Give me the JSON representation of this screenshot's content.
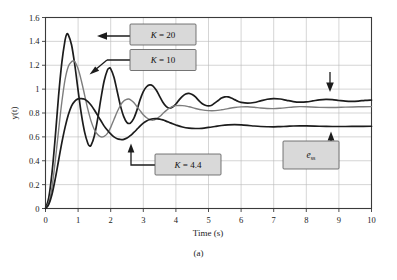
{
  "figure": {
    "caption": "(a)"
  },
  "chart_data": {
    "type": "line",
    "title": "",
    "subtitle": "",
    "xlabel": "Time (s)",
    "ylabel": "y(t)",
    "xlim": [
      0,
      10
    ],
    "ylim": [
      0,
      1.6
    ],
    "grid": true,
    "legend_position": "inline-annotations",
    "xticks": [
      "0",
      "1",
      "2",
      "3",
      "4",
      "5",
      "6",
      "7",
      "8",
      "9",
      "10"
    ],
    "xtick_values": [
      0,
      1,
      2,
      3,
      4,
      5,
      6,
      7,
      8,
      9,
      10
    ],
    "yticks": [
      "0",
      "0.2",
      "0.4",
      "0.6",
      "0.8",
      "1",
      "1.2",
      "1.4",
      "1.6"
    ],
    "ytick_values": [
      0,
      0.2,
      0.4,
      0.6,
      0.8,
      1.0,
      1.2,
      1.4,
      1.6
    ],
    "series": [
      {
        "name": "K = 20",
        "color": "#1c1c1c",
        "style": "dark-thick",
        "peak": 1.46,
        "peak_time": 0.65,
        "steady_state": 0.905,
        "x": [
          0,
          0.1,
          0.2,
          0.3,
          0.4,
          0.5,
          0.6,
          0.65,
          0.7,
          0.8,
          0.9,
          1.0,
          1.1,
          1.2,
          1.3,
          1.35,
          1.4,
          1.5,
          1.6,
          1.7,
          1.8,
          1.9,
          1.95,
          2.0,
          2.1,
          2.2,
          2.3,
          2.4,
          2.5,
          2.6,
          2.7,
          2.8,
          2.9,
          3.0,
          3.1,
          3.2,
          3.3,
          3.4,
          3.5,
          3.6,
          3.7,
          3.8,
          3.9,
          4.0,
          4.1,
          4.2,
          4.3,
          4.4,
          4.5,
          4.6,
          4.7,
          4.8,
          4.9,
          5.0,
          5.1,
          5.2,
          5.3,
          5.4,
          5.5,
          5.6,
          5.7,
          5.8,
          5.9,
          6.0,
          6.2,
          6.4,
          6.6,
          6.8,
          7.0,
          7.2,
          7.4,
          7.6,
          7.8,
          8.0,
          8.2,
          8.4,
          8.6,
          8.8,
          9.0,
          9.2,
          9.4,
          9.6,
          9.8,
          10.0
        ],
        "y": [
          0,
          0.09,
          0.3,
          0.6,
          0.94,
          1.22,
          1.41,
          1.46,
          1.455,
          1.37,
          1.2,
          0.99,
          0.79,
          0.64,
          0.545,
          0.525,
          0.53,
          0.61,
          0.75,
          0.92,
          1.07,
          1.16,
          1.175,
          1.17,
          1.1,
          0.98,
          0.86,
          0.77,
          0.72,
          0.715,
          0.75,
          0.82,
          0.91,
          0.98,
          1.02,
          1.035,
          1.025,
          0.99,
          0.94,
          0.89,
          0.855,
          0.84,
          0.85,
          0.875,
          0.91,
          0.94,
          0.96,
          0.965,
          0.955,
          0.935,
          0.905,
          0.88,
          0.865,
          0.86,
          0.865,
          0.885,
          0.905,
          0.925,
          0.935,
          0.935,
          0.925,
          0.912,
          0.898,
          0.889,
          0.882,
          0.888,
          0.902,
          0.915,
          0.921,
          0.917,
          0.906,
          0.896,
          0.891,
          0.893,
          0.901,
          0.91,
          0.914,
          0.912,
          0.905,
          0.899,
          0.897,
          0.9,
          0.906,
          0.909
        ]
      },
      {
        "name": "K = 10",
        "color": "#7d7d7d",
        "style": "gray-thin",
        "peak": 1.235,
        "peak_time": 0.85,
        "steady_state": 0.855,
        "x": [
          0,
          0.1,
          0.2,
          0.3,
          0.4,
          0.5,
          0.6,
          0.7,
          0.8,
          0.85,
          0.9,
          1.0,
          1.1,
          1.2,
          1.3,
          1.4,
          1.5,
          1.6,
          1.7,
          1.8,
          1.9,
          2.0,
          2.1,
          2.2,
          2.3,
          2.4,
          2.5,
          2.55,
          2.6,
          2.7,
          2.8,
          2.9,
          3.0,
          3.1,
          3.2,
          3.3,
          3.4,
          3.5,
          3.6,
          3.7,
          3.8,
          3.9,
          4.0,
          4.2,
          4.4,
          4.6,
          4.8,
          5.0,
          5.2,
          5.4,
          5.6,
          5.8,
          6.0,
          6.2,
          6.4,
          6.6,
          6.8,
          7.0,
          7.2,
          7.4,
          7.6,
          7.8,
          8.0,
          8.4,
          8.8,
          9.2,
          9.6,
          10.0
        ],
        "y": [
          0,
          0.05,
          0.18,
          0.4,
          0.65,
          0.89,
          1.08,
          1.19,
          1.23,
          1.235,
          1.23,
          1.17,
          1.07,
          0.95,
          0.83,
          0.73,
          0.66,
          0.62,
          0.6,
          0.605,
          0.63,
          0.68,
          0.745,
          0.81,
          0.865,
          0.9,
          0.915,
          0.917,
          0.912,
          0.89,
          0.855,
          0.82,
          0.785,
          0.76,
          0.745,
          0.74,
          0.75,
          0.77,
          0.795,
          0.82,
          0.84,
          0.855,
          0.862,
          0.862,
          0.852,
          0.838,
          0.826,
          0.82,
          0.82,
          0.827,
          0.837,
          0.846,
          0.851,
          0.852,
          0.848,
          0.842,
          0.838,
          0.837,
          0.84,
          0.845,
          0.85,
          0.853,
          0.852,
          0.847,
          0.846,
          0.849,
          0.852,
          0.853
        ]
      },
      {
        "name": "K = 4.4",
        "color": "#1c1c1c",
        "style": "dark-thick",
        "peak": 0.92,
        "peak_time": 1.15,
        "steady_state": 0.688,
        "x": [
          0,
          0.1,
          0.2,
          0.3,
          0.4,
          0.5,
          0.6,
          0.7,
          0.8,
          0.9,
          1.0,
          1.1,
          1.15,
          1.2,
          1.3,
          1.4,
          1.5,
          1.6,
          1.7,
          1.8,
          1.9,
          2.0,
          2.1,
          2.2,
          2.3,
          2.35,
          2.4,
          2.5,
          2.6,
          2.7,
          2.8,
          2.9,
          3.0,
          3.1,
          3.2,
          3.3,
          3.4,
          3.5,
          3.6,
          3.7,
          3.8,
          3.9,
          4.0,
          4.2,
          4.4,
          4.6,
          4.8,
          5.0,
          5.2,
          5.4,
          5.6,
          5.8,
          6.0,
          6.2,
          6.4,
          6.6,
          6.8,
          7.0,
          7.2,
          7.4,
          7.6,
          7.8,
          8.0,
          8.4,
          8.8,
          9.2,
          9.6,
          10.0
        ],
        "y": [
          0,
          0.035,
          0.12,
          0.25,
          0.4,
          0.55,
          0.68,
          0.785,
          0.86,
          0.9,
          0.918,
          0.92,
          0.919,
          0.915,
          0.895,
          0.865,
          0.825,
          0.78,
          0.735,
          0.69,
          0.655,
          0.625,
          0.6,
          0.585,
          0.578,
          0.577,
          0.579,
          0.59,
          0.61,
          0.635,
          0.662,
          0.69,
          0.715,
          0.733,
          0.745,
          0.752,
          0.753,
          0.749,
          0.742,
          0.732,
          0.721,
          0.71,
          0.7,
          0.683,
          0.673,
          0.67,
          0.672,
          0.679,
          0.687,
          0.695,
          0.7,
          0.702,
          0.7,
          0.696,
          0.691,
          0.687,
          0.685,
          0.684,
          0.686,
          0.688,
          0.691,
          0.692,
          0.692,
          0.689,
          0.687,
          0.687,
          0.688,
          0.689
        ]
      }
    ],
    "annotations": [
      {
        "id": "k20",
        "label": "K = 20",
        "label_prefix": "K",
        "label_value": "20",
        "points_to": [
          0.72,
          1.455
        ]
      },
      {
        "id": "k10",
        "label": "K = 10",
        "label_prefix": "K",
        "label_value": "10",
        "points_to": [
          0.97,
          1.19
        ]
      },
      {
        "id": "k44",
        "label": "K = 4.4",
        "label_prefix": "K",
        "label_value": "4.4",
        "points_to": [
          2.35,
          0.6
        ]
      },
      {
        "id": "ess",
        "label": "e_ss",
        "label_prefix": "e",
        "label_value": "ss",
        "points_to": [
          8.6,
          0.695
        ]
      },
      {
        "id": "down-arrow",
        "label": "",
        "points_to": [
          8.55,
          0.93
        ]
      }
    ]
  }
}
